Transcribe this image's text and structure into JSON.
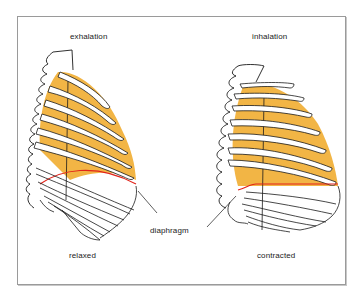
{
  "diagram": {
    "panels": [
      {
        "id": "left",
        "phase_label": "exhalation",
        "state_label": "relaxed"
      },
      {
        "id": "right",
        "phase_label": "inhalation",
        "state_label": "contracted"
      }
    ],
    "shared_label": "diaphragm",
    "colors": {
      "lung_fill": "#F2B545",
      "diaphragm_line": "#E2231A",
      "outline": "#1a1a1a",
      "frame_border": "#9a9a9a",
      "background": "#FFFFFF"
    }
  }
}
